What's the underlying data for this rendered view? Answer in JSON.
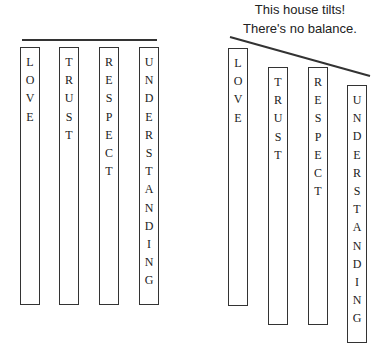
{
  "caption": {
    "line1": "This house tilts!",
    "line2": "There's no balance."
  },
  "houses": [
    {
      "name": "balanced-house",
      "roof": {
        "x1": 22,
        "y1": 40,
        "x2": 157,
        "y2": 40
      },
      "pillars": [
        {
          "word": "LOVE",
          "x": 20,
          "top": 47,
          "bottom": 305
        },
        {
          "word": "TRUST",
          "x": 59,
          "top": 47,
          "bottom": 305
        },
        {
          "word": "RESPECT",
          "x": 99,
          "top": 47,
          "bottom": 305
        },
        {
          "word": "UNDERSTANDING",
          "x": 139,
          "top": 47,
          "bottom": 305
        }
      ]
    },
    {
      "name": "tilted-house",
      "roof": {
        "x1": 230,
        "y1": 37,
        "x2": 370,
        "y2": 76
      },
      "pillars": [
        {
          "word": "LOVE",
          "x": 228,
          "top": 48,
          "bottom": 306
        },
        {
          "word": "TRUST",
          "x": 268,
          "top": 67,
          "bottom": 325
        },
        {
          "word": "RESPECT",
          "x": 308,
          "top": 67,
          "bottom": 325
        },
        {
          "word": "UNDERSTANDING",
          "x": 347,
          "top": 85,
          "bottom": 343
        }
      ]
    }
  ]
}
